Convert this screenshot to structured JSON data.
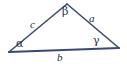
{
  "figure": {
    "type": "geometry-diagram",
    "shape": "triangle",
    "background_color": "#ffffff",
    "stroke_color": "#3b4a6e",
    "label_color": "#26304d",
    "width": 127,
    "height": 67
  },
  "vertices": {
    "left": {
      "name": "A",
      "x": 9,
      "y": 52
    },
    "apex": {
      "name": "B",
      "x": 67,
      "y": 4
    },
    "right": {
      "name": "C",
      "x": 119,
      "y": 48
    }
  },
  "angle_labels": {
    "left": "α",
    "apex": "β",
    "right": "γ"
  },
  "side_labels": {
    "left_side": "c",
    "right_side": "a",
    "base": "b"
  },
  "edges": [
    {
      "name": "side-c",
      "from": "left",
      "to": "apex",
      "label": "c",
      "stroke_width": 1.6
    },
    {
      "name": "side-a",
      "from": "apex",
      "to": "right",
      "label": "a",
      "stroke_width": 1.6
    },
    {
      "name": "side-b",
      "from": "left",
      "to": "right",
      "label": "b",
      "stroke_width": 2.2
    }
  ]
}
